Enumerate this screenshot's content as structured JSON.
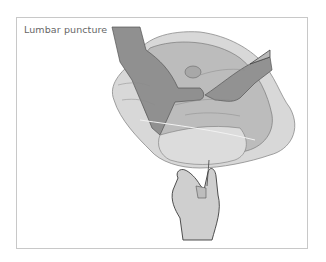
{
  "figure": {
    "title": "Lumbar puncture",
    "colors": {
      "light_fill": "#d4d4d4",
      "mid_fill": "#b4b4b4",
      "dark_fill": "#8e8e8e",
      "outline": "#4a4a4a",
      "frame": "#c8c8c8"
    }
  }
}
